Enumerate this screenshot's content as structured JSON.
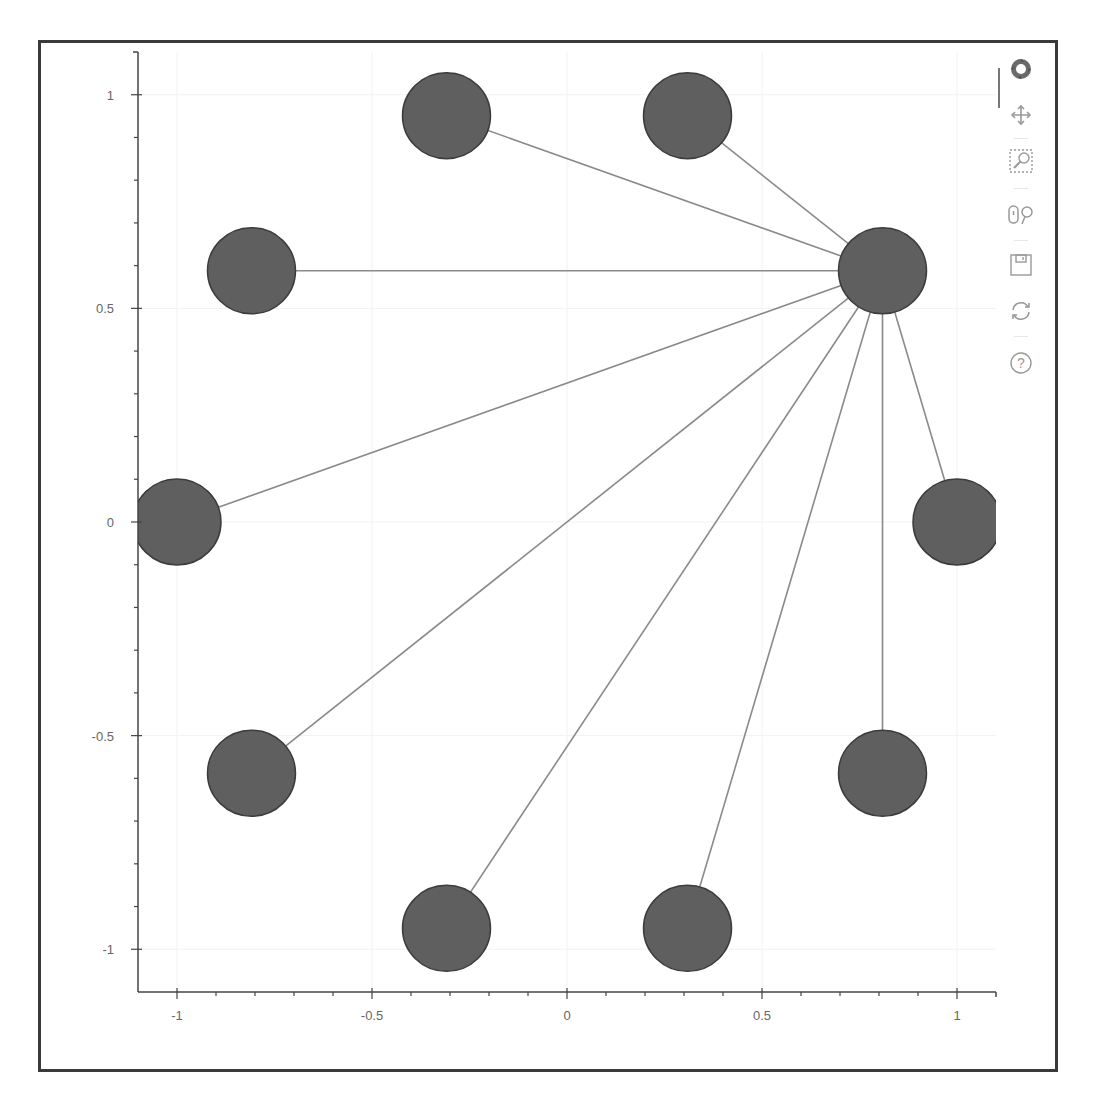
{
  "chart_data": {
    "type": "scatter",
    "subtype": "network-graph",
    "title": "",
    "xlabel": "",
    "ylabel": "",
    "xlim": [
      -1.1,
      1.1
    ],
    "ylim": [
      -1.1,
      1.1
    ],
    "grid": true,
    "x_ticks": [
      "-1",
      "-0.5",
      "0",
      "0.5",
      "1"
    ],
    "x_tick_values": [
      -1,
      -0.5,
      0,
      0.5,
      1
    ],
    "y_ticks": [
      "1",
      "0.5",
      "0",
      "-0.5",
      "-1"
    ],
    "y_tick_values": [
      1,
      0.5,
      0,
      -0.5,
      -1
    ],
    "node_color": "#5f5f5f",
    "node_outline": "#3c3c3c",
    "edge_color": "#8a8a8a",
    "nodes": [
      {
        "id": 0,
        "x": 1.0,
        "y": 0.0
      },
      {
        "id": 1,
        "x": 0.809,
        "y": 0.588
      },
      {
        "id": 2,
        "x": 0.309,
        "y": 0.951
      },
      {
        "id": 3,
        "x": -0.309,
        "y": 0.951
      },
      {
        "id": 4,
        "x": -0.809,
        "y": 0.588
      },
      {
        "id": 5,
        "x": -1.0,
        "y": 0.0
      },
      {
        "id": 6,
        "x": -0.809,
        "y": -0.588
      },
      {
        "id": 7,
        "x": -0.309,
        "y": -0.951
      },
      {
        "id": 8,
        "x": 0.309,
        "y": -0.951
      },
      {
        "id": 9,
        "x": 0.809,
        "y": -0.588
      }
    ],
    "edges": [
      [
        1,
        0
      ],
      [
        1,
        2
      ],
      [
        1,
        3
      ],
      [
        1,
        4
      ],
      [
        1,
        5
      ],
      [
        1,
        6
      ],
      [
        1,
        7
      ],
      [
        1,
        8
      ],
      [
        1,
        9
      ]
    ]
  },
  "toolbar": {
    "logo": "bokeh-logo-icon",
    "tools": [
      {
        "name": "pan-tool",
        "active": true
      },
      {
        "name": "box-zoom-tool",
        "active": false
      },
      {
        "name": "wheel-zoom-tool",
        "active": false
      },
      {
        "name": "save-tool",
        "active": false
      },
      {
        "name": "reset-tool",
        "active": false
      },
      {
        "name": "help-tool",
        "active": false
      }
    ]
  }
}
